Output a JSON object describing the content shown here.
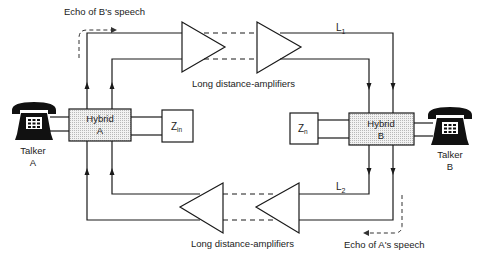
{
  "diagram": {
    "type": "echo-path telephone circuit",
    "labels": {
      "echo_b": "Echo of B's speech",
      "echo_a": "Echo of A's speech",
      "amps_top": "Long distance-amplifiers",
      "amps_bottom": "Long distance-amplifiers",
      "l1": "L",
      "l1_sub": "1",
      "l2": "L",
      "l2_sub": "2"
    },
    "hybrid_a": {
      "line1": "Hybrid",
      "line2": "A"
    },
    "hybrid_b": {
      "line1": "Hybrid",
      "line2": "B"
    },
    "zin": {
      "main": "Z",
      "sub": "in"
    },
    "zn": {
      "main": "Z",
      "sub": "n"
    },
    "talker_a": {
      "line1": "Talker",
      "line2": "A"
    },
    "talker_b": {
      "line1": "Talker",
      "line2": "B"
    },
    "icons": {
      "talker_a": "telephone-icon",
      "talker_b": "telephone-icon"
    }
  }
}
